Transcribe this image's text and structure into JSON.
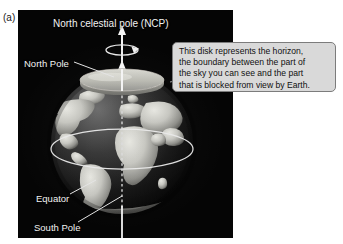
{
  "figure": {
    "panel_label": "(a)",
    "background_color": "#ffffff",
    "plate_color": "#050505"
  },
  "labels": {
    "ncp": "North celestial pole (NCP)",
    "north_pole": "North Pole",
    "equator": "Equator",
    "south_pole": "South Pole"
  },
  "callout": {
    "line1": "This disk represents the horizon,",
    "line2": "the boundary between the part of",
    "line3": "the sky you can see and the part",
    "line4": "that is blocked from view by Earth.",
    "fill_color": "#d9d9d9",
    "border_color": "#7c7c7c"
  },
  "diagram": {
    "globe_name": "Earth globe",
    "ocean_color": "#141414",
    "land_color": "#c9c9c4",
    "axis_color": "#f0f0f0",
    "horizon_disk_color": "#bfbfb8",
    "equator_line_color": "#e8e8e8",
    "leader_line_color": "#e6e6e6",
    "rotation_arrow_name": "rotation-direction-arrow"
  }
}
